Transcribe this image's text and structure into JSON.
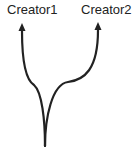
{
  "diagram": {
    "type": "branching-arrows",
    "nodes": [
      {
        "id": "creator1",
        "label": "Creator1"
      },
      {
        "id": "creator2",
        "label": "Creator2"
      }
    ],
    "edges": [
      {
        "from": "root",
        "to": "creator1"
      },
      {
        "from": "root",
        "to": "creator2"
      }
    ],
    "colors": {
      "stroke": "#222222",
      "text": "#222222",
      "background": "#ffffff"
    }
  }
}
